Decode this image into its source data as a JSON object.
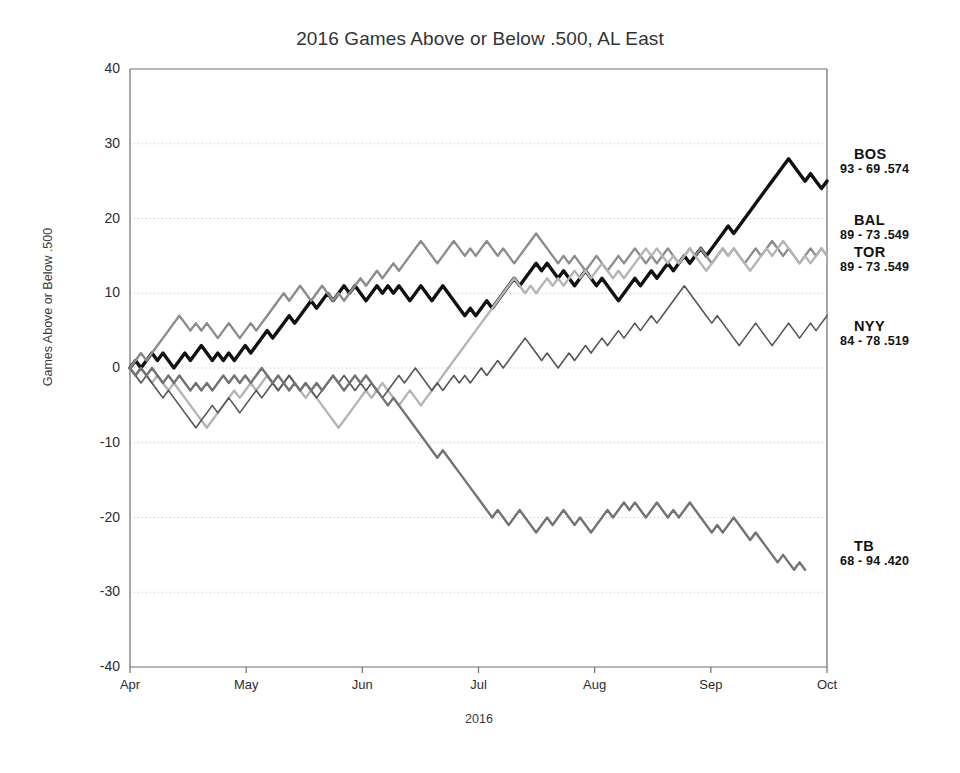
{
  "chart_data": {
    "type": "line",
    "title": "2016 Games Above or Below .500, AL East",
    "xlabel": "2016",
    "ylabel": "Games Above or Below .500",
    "ylim": [
      -40,
      40
    ],
    "yticks": [
      40,
      30,
      20,
      10,
      0,
      -10,
      -20,
      -30,
      -40
    ],
    "xticks": [
      "Apr",
      "May",
      "Jun",
      "Jul",
      "Aug",
      "Sep",
      "Oct"
    ],
    "grid": "horizontal-dotted",
    "legend_position": "right-of-axes-at-series-end",
    "series": [
      {
        "name": "BOS",
        "record": "93 - 69",
        "pct": ".574",
        "color": "#111111",
        "width": 3.4,
        "values": [
          0,
          1,
          0,
          1,
          2,
          1,
          2,
          1,
          0,
          1,
          2,
          1,
          2,
          3,
          2,
          1,
          2,
          1,
          2,
          1,
          2,
          3,
          2,
          3,
          4,
          5,
          4,
          5,
          6,
          7,
          6,
          7,
          8,
          9,
          8,
          9,
          10,
          9,
          10,
          11,
          10,
          11,
          10,
          9,
          10,
          11,
          10,
          11,
          10,
          11,
          10,
          9,
          10,
          11,
          10,
          9,
          10,
          11,
          10,
          9,
          8,
          7,
          8,
          7,
          8,
          9,
          8,
          9,
          10,
          11,
          12,
          11,
          12,
          13,
          14,
          13,
          14,
          13,
          12,
          13,
          12,
          11,
          12,
          13,
          12,
          11,
          12,
          11,
          10,
          9,
          10,
          11,
          12,
          11,
          12,
          13,
          12,
          13,
          14,
          13,
          14,
          15,
          14,
          15,
          16,
          15,
          16,
          17,
          18,
          19,
          18,
          19,
          20,
          21,
          22,
          23,
          24,
          25,
          26,
          27,
          28,
          27,
          26,
          25,
          26,
          25,
          24,
          25
        ]
      },
      {
        "name": "BAL",
        "record": "89 - 73",
        "pct": ".549",
        "color": "#8c8c8c",
        "width": 2.4,
        "values": [
          0,
          1,
          2,
          1,
          2,
          3,
          4,
          5,
          6,
          7,
          6,
          5,
          6,
          5,
          6,
          5,
          4,
          5,
          6,
          5,
          4,
          5,
          6,
          5,
          6,
          7,
          8,
          9,
          10,
          9,
          10,
          11,
          10,
          9,
          10,
          11,
          10,
          9,
          10,
          9,
          10,
          11,
          12,
          11,
          12,
          13,
          12,
          13,
          14,
          13,
          14,
          15,
          16,
          17,
          16,
          15,
          14,
          15,
          16,
          17,
          16,
          15,
          16,
          15,
          16,
          17,
          16,
          15,
          16,
          15,
          14,
          15,
          16,
          17,
          18,
          17,
          16,
          15,
          14,
          15,
          14,
          15,
          14,
          13,
          14,
          15,
          14,
          13,
          14,
          15,
          14,
          15,
          16,
          15,
          14,
          15,
          14,
          15,
          16,
          15,
          14,
          15,
          16,
          15,
          16,
          15,
          14,
          15,
          16,
          15,
          16,
          15,
          14,
          15,
          16,
          15,
          16,
          17,
          16,
          15,
          16,
          15,
          14,
          15,
          16,
          15,
          16,
          15
        ]
      },
      {
        "name": "TOR",
        "record": "89 - 73",
        "pct": ".549",
        "color": "#b5b5b5",
        "width": 2.4,
        "values": [
          0,
          -1,
          0,
          -1,
          -2,
          -1,
          -2,
          -3,
          -2,
          -3,
          -4,
          -5,
          -6,
          -7,
          -8,
          -7,
          -6,
          -5,
          -4,
          -3,
          -4,
          -3,
          -2,
          -3,
          -2,
          -1,
          -2,
          -3,
          -2,
          -1,
          -2,
          -3,
          -4,
          -3,
          -4,
          -5,
          -6,
          -7,
          -8,
          -7,
          -6,
          -5,
          -4,
          -3,
          -4,
          -3,
          -2,
          -3,
          -4,
          -5,
          -4,
          -3,
          -4,
          -5,
          -4,
          -3,
          -2,
          -1,
          0,
          1,
          2,
          3,
          4,
          5,
          6,
          7,
          8,
          9,
          10,
          11,
          12,
          11,
          10,
          11,
          10,
          11,
          12,
          11,
          12,
          11,
          12,
          13,
          12,
          13,
          12,
          13,
          14,
          13,
          12,
          13,
          12,
          13,
          14,
          15,
          16,
          15,
          16,
          15,
          14,
          15,
          14,
          15,
          16,
          15,
          14,
          13,
          14,
          15,
          16,
          15,
          16,
          15,
          14,
          13,
          14,
          15,
          16,
          15,
          16,
          17,
          16,
          15,
          14,
          15,
          14,
          15,
          16,
          15
        ]
      },
      {
        "name": "NYY",
        "record": "84 - 78",
        "pct": ".519",
        "color": "#555555",
        "width": 1.6,
        "values": [
          0,
          -1,
          -2,
          -1,
          -2,
          -3,
          -4,
          -3,
          -4,
          -5,
          -6,
          -7,
          -8,
          -7,
          -6,
          -5,
          -6,
          -5,
          -4,
          -5,
          -6,
          -5,
          -4,
          -3,
          -4,
          -3,
          -2,
          -3,
          -2,
          -1,
          -2,
          -3,
          -2,
          -3,
          -4,
          -3,
          -2,
          -1,
          -2,
          -1,
          -2,
          -3,
          -2,
          -3,
          -2,
          -3,
          -4,
          -3,
          -2,
          -1,
          -2,
          -1,
          0,
          -1,
          -2,
          -3,
          -2,
          -3,
          -2,
          -1,
          -2,
          -1,
          -2,
          -1,
          0,
          -1,
          0,
          1,
          0,
          1,
          2,
          3,
          4,
          3,
          2,
          1,
          2,
          1,
          0,
          1,
          2,
          1,
          2,
          3,
          2,
          3,
          4,
          3,
          4,
          5,
          4,
          5,
          6,
          5,
          6,
          7,
          6,
          7,
          8,
          9,
          10,
          11,
          10,
          9,
          8,
          7,
          6,
          7,
          6,
          5,
          4,
          3,
          4,
          5,
          6,
          5,
          4,
          3,
          4,
          5,
          6,
          5,
          4,
          5,
          6,
          5,
          6,
          7
        ]
      },
      {
        "name": "TB",
        "record": "68 - 94",
        "pct": ".420",
        "color": "#737373",
        "width": 2.4,
        "values": [
          0,
          -1,
          0,
          -1,
          0,
          -1,
          -2,
          -1,
          -2,
          -1,
          -2,
          -3,
          -2,
          -3,
          -2,
          -3,
          -2,
          -1,
          -2,
          -1,
          -2,
          -1,
          -2,
          -1,
          0,
          -1,
          -2,
          -1,
          -2,
          -3,
          -2,
          -3,
          -2,
          -3,
          -2,
          -3,
          -2,
          -1,
          -2,
          -3,
          -2,
          -1,
          -2,
          -1,
          -2,
          -3,
          -4,
          -5,
          -4,
          -5,
          -6,
          -7,
          -8,
          -9,
          -10,
          -11,
          -12,
          -11,
          -12,
          -13,
          -14,
          -15,
          -16,
          -17,
          -18,
          -19,
          -20,
          -19,
          -20,
          -21,
          -20,
          -19,
          -20,
          -21,
          -22,
          -21,
          -20,
          -21,
          -20,
          -19,
          -20,
          -21,
          -20,
          -21,
          -22,
          -21,
          -20,
          -19,
          -20,
          -19,
          -18,
          -19,
          -18,
          -19,
          -20,
          -19,
          -18,
          -19,
          -20,
          -19,
          -20,
          -19,
          -18,
          -19,
          -20,
          -21,
          -22,
          -21,
          -22,
          -21,
          -20,
          -21,
          -22,
          -23,
          -22,
          -23,
          -24,
          -25,
          -26,
          -25,
          -26,
          -27,
          -26,
          -27
        ]
      }
    ]
  },
  "legend": [
    {
      "team": "BOS",
      "record": "93 - 69  .574",
      "top": 146
    },
    {
      "team": "BAL",
      "record": "89 - 73  .549",
      "top": 212
    },
    {
      "team": "TOR",
      "record": "89 - 73  .549",
      "top": 244
    },
    {
      "team": "NYY",
      "record": "84 - 78  .519",
      "top": 318
    },
    {
      "team": "TB",
      "record": "68 - 94  .420",
      "top": 538
    }
  ]
}
